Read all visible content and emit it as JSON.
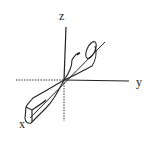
{
  "diagram": {
    "type": "3d-axes-radiation-pattern",
    "axes": {
      "x": {
        "label": "x"
      },
      "y": {
        "label": "y"
      },
      "z": {
        "label": "z"
      }
    },
    "lobes": [
      {
        "name": "upper-lobe",
        "direction": "toward -x / upper-right"
      },
      {
        "name": "lower-lobe",
        "direction": "toward +x / lower-left"
      }
    ],
    "colors": {
      "line": "#222222",
      "background": "#ffffff"
    }
  }
}
